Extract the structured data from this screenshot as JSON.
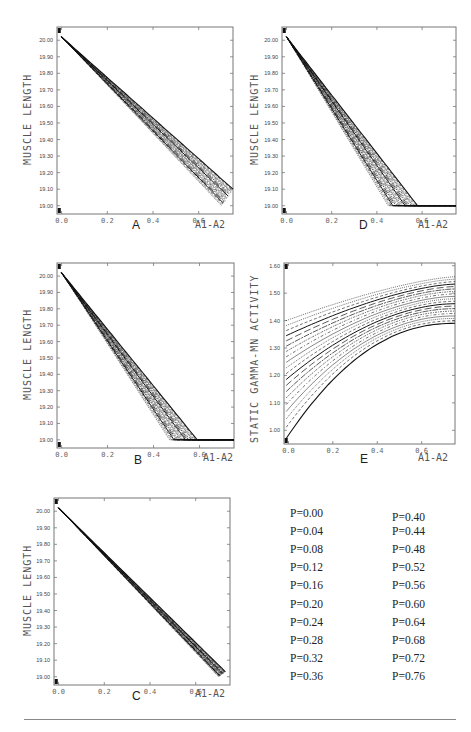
{
  "figure": {
    "panels": [
      {
        "id": "A",
        "letter": "A",
        "xlabel": "A1-A2",
        "ylabel": "MUSCLE LENGTH",
        "box": {
          "left": 57,
          "top": 27,
          "width": 176,
          "height": 187
        },
        "letter_pos": {
          "left": 132,
          "top": 218
        },
        "xlabel_pos": {
          "left": 195,
          "top": 219
        },
        "ylabel_pos": {
          "left": 22,
          "top": 165
        }
      },
      {
        "id": "D",
        "letter": "D",
        "xlabel": "A1-A2",
        "ylabel": "MUSCLE LENGTH",
        "box": {
          "left": 282,
          "top": 27,
          "width": 174,
          "height": 187
        },
        "letter_pos": {
          "left": 359,
          "top": 218
        },
        "xlabel_pos": {
          "left": 418,
          "top": 219
        },
        "ylabel_pos": {
          "left": 249,
          "top": 165
        }
      },
      {
        "id": "B",
        "letter": "B",
        "xlabel": "A1-A2",
        "ylabel": "MUSCLE LENGTH",
        "box": {
          "left": 57,
          "top": 263,
          "width": 177,
          "height": 185
        },
        "letter_pos": {
          "left": 134,
          "top": 453
        },
        "xlabel_pos": {
          "left": 203,
          "top": 452
        },
        "ylabel_pos": {
          "left": 22,
          "top": 400
        }
      },
      {
        "id": "E",
        "letter": "E",
        "xlabel": "A1-A2",
        "ylabel": "STATIC GAMMA-MN ACTIVITY",
        "box": {
          "left": 284,
          "top": 263,
          "width": 171,
          "height": 181
        },
        "letter_pos": {
          "left": 360,
          "top": 452
        },
        "xlabel_pos": {
          "left": 418,
          "top": 452
        },
        "ylabel_pos": {
          "left": 249,
          "top": 443
        }
      },
      {
        "id": "C",
        "letter": "C",
        "xlabel": "A1-A2",
        "ylabel": "MUSCLE LENGTH",
        "box": {
          "left": 54,
          "top": 498,
          "width": 176,
          "height": 187
        },
        "letter_pos": {
          "left": 132,
          "top": 689
        },
        "xlabel_pos": {
          "left": 195,
          "top": 688
        },
        "ylabel_pos": {
          "left": 22,
          "top": 636
        }
      }
    ],
    "legend": {
      "columns": [
        {
          "left": 287,
          "top": 505,
          "items": [
            {
              "label": "P=0.00",
              "dash": "solid"
            },
            {
              "label": "P=0.04",
              "dash": "3,2"
            },
            {
              "label": "P=0.08",
              "dash": "1,1"
            },
            {
              "label": "P=0.12",
              "dash": "solid-thin"
            },
            {
              "label": "P=0.16",
              "dash": "3,2,1,2"
            },
            {
              "label": "P=0.20",
              "dash": "2,1,1,1"
            },
            {
              "label": "P=0.24",
              "dash": "6,1,2,1"
            },
            {
              "label": "P=0.28",
              "dash": "7,3"
            },
            {
              "label": "P=0.32",
              "dash": "solid"
            },
            {
              "label": "P=0.36",
              "dash": "3,2"
            }
          ]
        },
        {
          "left": 389,
          "top": 505,
          "items": [
            {
              "label": "P=0.40",
              "dash": "1,1"
            },
            {
              "label": "P=0.44",
              "dash": "solid-thin"
            },
            {
              "label": "P=0.48",
              "dash": "3,2,1,2"
            },
            {
              "label": "P=0.52",
              "dash": "2,1,1,1"
            },
            {
              "label": "P=0.56",
              "dash": "6,1,2,1"
            },
            {
              "label": "P=0.60",
              "dash": "7,3"
            },
            {
              "label": "P=0.64",
              "dash": "solid"
            },
            {
              "label": "P=0.68",
              "dash": "3,2"
            },
            {
              "label": "P=0.72",
              "dash": "1,1"
            },
            {
              "label": "P=0.76",
              "dash": "1,1"
            }
          ]
        }
      ]
    }
  },
  "chart_data": [
    {
      "type": "line",
      "id": "A",
      "title": "A",
      "xlabel": "A1-A2",
      "ylabel": "MUSCLE LENGTH",
      "xlim": [
        -0.02,
        0.75
      ],
      "ylim": [
        18.95,
        20.08
      ],
      "xticks": [
        0.0,
        0.2,
        0.4,
        0.6
      ],
      "xtick_labels": [
        "0.0",
        "0.2",
        "0.4",
        "0.6"
      ],
      "yticks": [
        19.0,
        19.1,
        19.2,
        19.3,
        19.4,
        19.5,
        19.6,
        19.7,
        19.8,
        19.9,
        20.0
      ],
      "ytick_labels": [
        "19.00",
        "19.10",
        "19.20",
        "19.30",
        "19.40",
        "19.50",
        "19.60",
        "19.70",
        "19.80",
        "19.90",
        "20.00"
      ],
      "grid": false,
      "series_note": "20 curves P=0.00..0.76; near-linear decline from 20.02 at x=0 to ~19.0 at x~0.72-0.75, fanning out after x~0.2",
      "series": {
        "x_start": 0.0,
        "y_start": 20.02,
        "x_end_min": 0.7,
        "x_end_max": 0.75,
        "y_end_min": 19.0,
        "y_end_max": 19.1,
        "fan_start": 0.2,
        "plateau": false
      }
    },
    {
      "type": "line",
      "id": "D",
      "title": "D",
      "xlabel": "A1-A2",
      "ylabel": "MUSCLE LENGTH",
      "xlim": [
        -0.02,
        0.75
      ],
      "ylim": [
        18.95,
        20.08
      ],
      "xticks": [
        0.0,
        0.2,
        0.4,
        0.6
      ],
      "xtick_labels": [
        "0.0",
        "0.2",
        "0.4",
        "0.6"
      ],
      "yticks": [
        19.0,
        19.1,
        19.2,
        19.3,
        19.4,
        19.5,
        19.6,
        19.7,
        19.8,
        19.9,
        20.0
      ],
      "ytick_labels": [
        "19.00",
        "19.10",
        "19.20",
        "19.30",
        "19.40",
        "19.50",
        "19.60",
        "19.70",
        "19.80",
        "19.90",
        "20.00"
      ],
      "grid": false,
      "series_note": "20 curves; linear decline from 20.02, reaching 19.00 between x~0.45 and x~0.58, then flat at 19.00",
      "series": {
        "x_start": 0.0,
        "y_start": 20.02,
        "x_end_min": 0.45,
        "x_end_max": 0.58,
        "y_end_min": 19.0,
        "y_end_max": 19.0,
        "fan_start": 0.02,
        "plateau": true
      }
    },
    {
      "type": "line",
      "id": "B",
      "title": "B",
      "xlabel": "A1-A2",
      "ylabel": "MUSCLE LENGTH",
      "xlim": [
        -0.02,
        0.75
      ],
      "ylim": [
        18.95,
        20.08
      ],
      "xticks": [
        0.0,
        0.2,
        0.4,
        0.6
      ],
      "xtick_labels": [
        "0.0",
        "0.2",
        "0.4",
        "0.6"
      ],
      "yticks": [
        19.0,
        19.1,
        19.2,
        19.3,
        19.4,
        19.5,
        19.6,
        19.7,
        19.8,
        19.9,
        20.0
      ],
      "ytick_labels": [
        "19.00",
        "19.10",
        "19.20",
        "19.30",
        "19.40",
        "19.50",
        "19.60",
        "19.70",
        "19.80",
        "19.90",
        "20.00"
      ],
      "grid": false,
      "series_note": "20 curves; linear decline from 20.02, reaching 19.00 between x~0.47 and x~0.59, then flat",
      "series": {
        "x_start": 0.0,
        "y_start": 20.02,
        "x_end_min": 0.47,
        "x_end_max": 0.59,
        "y_end_min": 19.0,
        "y_end_max": 19.0,
        "fan_start": 0.03,
        "plateau": true
      }
    },
    {
      "type": "line",
      "id": "E",
      "title": "E",
      "xlabel": "A1-A2",
      "ylabel": "STATIC GAMMA-MN ACTIVITY",
      "xlim": [
        -0.02,
        0.75
      ],
      "ylim": [
        0.95,
        1.61
      ],
      "xticks": [
        0.0,
        0.2,
        0.4,
        0.6
      ],
      "xtick_labels": [
        "0.0",
        "0.2",
        "0.4",
        "0.6"
      ],
      "yticks": [
        1.0,
        1.1,
        1.2,
        1.3,
        1.4,
        1.5,
        1.6
      ],
      "ytick_labels": [
        "1.00",
        "1.10",
        "1.20",
        "1.30",
        "1.40",
        "1.50",
        "1.60"
      ],
      "grid": false,
      "series_note": "20 concave increasing curves; at x=0 values span ~0.97 (P=0.00) to ~1.40 (P=0.76); at x=0.75 span ~1.39 to ~1.56",
      "series": {
        "y_start_min": 0.97,
        "y_start_max": 1.4,
        "y_end_min": 1.39,
        "y_end_max": 1.56
      }
    },
    {
      "type": "line",
      "id": "C",
      "title": "C",
      "xlabel": "A1-A2",
      "ylabel": "MUSCLE LENGTH",
      "xlim": [
        -0.02,
        0.75
      ],
      "ylim": [
        18.95,
        20.08
      ],
      "xticks": [
        0.0,
        0.2,
        0.4,
        0.6
      ],
      "xtick_labels": [
        "0.0",
        "0.2",
        "0.4",
        "0.6"
      ],
      "yticks": [
        19.0,
        19.1,
        19.2,
        19.3,
        19.4,
        19.5,
        19.6,
        19.7,
        19.8,
        19.9,
        20.0
      ],
      "ytick_labels": [
        "19.00",
        "19.10",
        "19.20",
        "19.30",
        "19.40",
        "19.50",
        "19.60",
        "19.70",
        "19.80",
        "19.90",
        "20.00"
      ],
      "grid": false,
      "series_note": "20 nearly overlapping curves; near-linear decline from 20.02 to 19.00 at x~0.72, narrow band widening slightly after x~0.4",
      "series": {
        "x_start": 0.0,
        "y_start": 20.02,
        "x_end_min": 0.7,
        "x_end_max": 0.73,
        "y_end_min": 19.0,
        "y_end_max": 19.03,
        "fan_start": 0.35,
        "plateau": false
      }
    }
  ]
}
